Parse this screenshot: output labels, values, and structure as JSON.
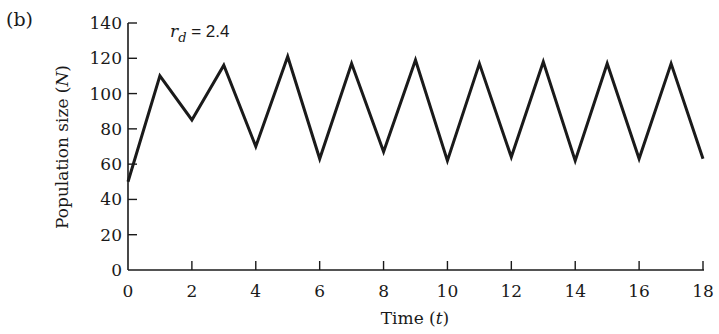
{
  "panel_label": "(b)",
  "annotation": {
    "symbol": "r",
    "subscript": "d",
    "text": " = 2.4"
  },
  "chart_data": {
    "type": "line",
    "title": "",
    "xlabel": "Time (t)",
    "ylabel": "Population size (N)",
    "xlim": [
      0,
      18
    ],
    "ylim": [
      0,
      140
    ],
    "xticks": [
      0,
      2,
      4,
      6,
      8,
      10,
      12,
      14,
      16,
      18
    ],
    "yticks": [
      0,
      20,
      40,
      60,
      80,
      100,
      120,
      140
    ],
    "grid": false,
    "legend": null,
    "annotations": [
      "r_d = 2.4"
    ],
    "series": [
      {
        "name": "N",
        "x": [
          0,
          1,
          2,
          3,
          4,
          5,
          6,
          7,
          8,
          9,
          10,
          11,
          12,
          13,
          14,
          15,
          16,
          17,
          18
        ],
        "values": [
          50,
          110,
          85,
          116,
          70,
          121,
          63,
          117,
          67,
          119,
          62,
          117,
          64,
          118,
          62,
          117,
          63,
          117,
          63
        ]
      }
    ]
  }
}
